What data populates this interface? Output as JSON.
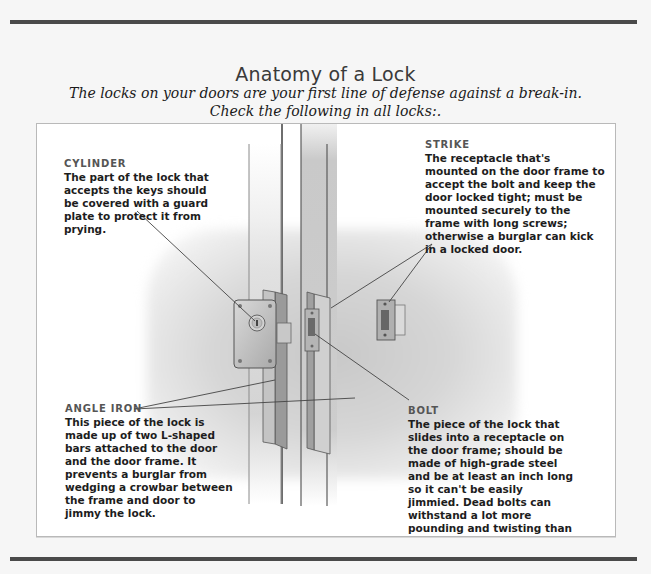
{
  "header": {
    "title": "Anatomy of a Lock",
    "subtitle_line1": "The locks on your doors are your first line of defense against a break-in.",
    "subtitle_line2": "Check the following in all locks:."
  },
  "callouts": {
    "cylinder": {
      "heading": "CYLINDER",
      "body": "The part of the lock that accepts the keys should be covered with a guard plate to protect it from prying."
    },
    "strike": {
      "heading": "STRIKE",
      "body": "The receptacle that's mounted on the door frame to accept the bolt and keep the door locked tight; must be mounted securely to the frame with long screws; otherwise a burglar can kick in a locked door."
    },
    "angle_iron": {
      "heading": "ANGLE IRON",
      "body": "This piece of the lock is made up of two L-shaped bars attached to the door and the door frame. It prevents a burglar from wedging a crowbar between the frame and door to jimmy the lock."
    },
    "bolt": {
      "heading": "BOLT",
      "body": "The piece of the lock that slides into a receptacle on the door frame; should be made of high-grade steel and be at least an inch long so it can't be easily jimmied. Dead bolts can withstand a lot more pounding and twisting than regular locks."
    }
  },
  "illustration": {
    "label": "lock-anatomy-illustration",
    "colors": {
      "metal": "#b8b8b8",
      "metal_dark": "#7a7a7a",
      "door_edge": "#cfcfcf",
      "leader_line": "#444444"
    }
  }
}
